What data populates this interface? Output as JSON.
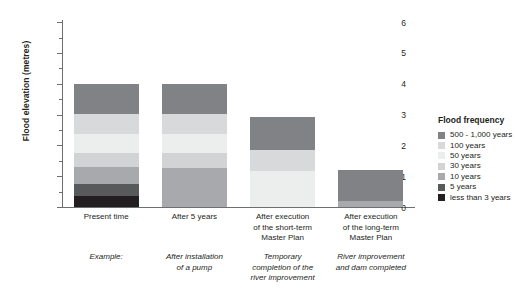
{
  "chart_data": {
    "type": "bar",
    "title": "",
    "stacked": true,
    "xlabel": "",
    "ylabel": "Flood elevation (metres)",
    "ylim": [
      0,
      6.1
    ],
    "ytick_labels": [
      "0",
      "1",
      "2",
      "3",
      "4",
      "5",
      "6"
    ],
    "ytick_values": [
      0,
      1,
      2,
      3,
      4,
      5,
      6
    ],
    "yminor_step": 0.5,
    "grid": false,
    "legend_position": "right",
    "legend_title": "Flood frequency",
    "categories": [
      "Present time",
      "After 5 years",
      "After execution of the short-term Master Plan",
      "After execution of the long-term Master Plan"
    ],
    "category_lines": [
      [
        "Present time"
      ],
      [
        "After 5 years"
      ],
      [
        "After execution",
        "of the short-term",
        "Master Plan"
      ],
      [
        "After execution",
        "of the long-term",
        "Master Plan"
      ]
    ],
    "annotation_label": "Example:",
    "annotation_lines": [
      [
        "Example:"
      ],
      [
        "After installation",
        "of a pump"
      ],
      [
        "Temporary",
        "completion of the",
        "river improvement"
      ],
      [
        "River improvement",
        "and dam completed"
      ]
    ],
    "series": [
      {
        "name": "less than 3 years",
        "color": "#231f20",
        "values": [
          0.35,
          0,
          0,
          0
        ]
      },
      {
        "name": "5 years",
        "color": "#58595b",
        "values": [
          0.4,
          0,
          0,
          0
        ]
      },
      {
        "name": "10 years",
        "color": "#a7a9ac",
        "values": [
          0.55,
          1.25,
          0,
          0.2
        ]
      },
      {
        "name": "30 years",
        "color": "#d1d3d4",
        "values": [
          0.45,
          0.5,
          0,
          0
        ]
      },
      {
        "name": "50 years",
        "color": "#eceded",
        "values": [
          0.6,
          0.6,
          1.15,
          0
        ]
      },
      {
        "name": "100 years",
        "color": "#d8d9da",
        "values": [
          0.65,
          0.65,
          0.7,
          0
        ]
      },
      {
        "name": "500 - 1,000 years",
        "color": "#808285",
        "values": [
          1.0,
          1.0,
          1.05,
          1.0
        ]
      }
    ],
    "totals": [
      4.0,
      4.0,
      2.9,
      1.2
    ],
    "legend_entries": [
      {
        "label": "500 - 1,000 years",
        "color": "#808285"
      },
      {
        "label": "100 years",
        "color": "#d8d9da"
      },
      {
        "label": "50 years",
        "color": "#eceded"
      },
      {
        "label": "30 years",
        "color": "#d1d3d4"
      },
      {
        "label": "10 years",
        "color": "#a7a9ac"
      },
      {
        "label": "5 years",
        "color": "#58595b"
      },
      {
        "label": "less than 3 years",
        "color": "#231f20"
      }
    ]
  }
}
